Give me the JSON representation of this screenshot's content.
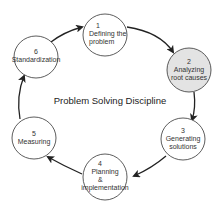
{
  "diagram": {
    "title": "Problem Solving Discipline",
    "colors": {
      "stroke": "#222222",
      "node_fill": "#ffffff",
      "highlight_fill": "#e3e3e3",
      "text": "#333333"
    },
    "nodes": [
      {
        "number": "1",
        "lines": [
          "Defining the",
          "problem"
        ],
        "highlighted": false
      },
      {
        "number": "2",
        "lines": [
          "Analyzing",
          "root causes"
        ],
        "highlighted": true
      },
      {
        "number": "3",
        "lines": [
          "Generating",
          "solutions"
        ],
        "highlighted": false
      },
      {
        "number": "4",
        "lines": [
          "Planning",
          "&",
          "implementation"
        ],
        "highlighted": false
      },
      {
        "number": "5",
        "lines": [
          "Measuring"
        ],
        "highlighted": false
      },
      {
        "number": "6",
        "lines": [
          "Standardization"
        ],
        "highlighted": false
      }
    ],
    "flow": [
      "1 → 2",
      "2 → 3",
      "3 → 4",
      "4 → 5",
      "5 → 6",
      "6 → 1"
    ]
  }
}
